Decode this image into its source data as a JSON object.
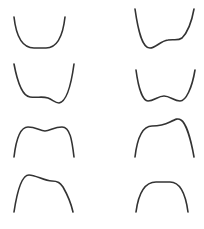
{
  "figure": {
    "stroke_color": "#333333",
    "background": "#ffffff",
    "curves": [
      {
        "id": "u-flat-bottom",
        "shape": "U-shaped well with flat bottom",
        "row": 1,
        "col": 1
      },
      {
        "id": "double-well-left-min",
        "shape": "Asymmetric well, deeper minimum on left with shoulder on right",
        "row": 1,
        "col": 2
      },
      {
        "id": "double-well-right-min",
        "shape": "Asymmetric well, shoulder on left, deeper minimum on right",
        "row": 2,
        "col": 1
      },
      {
        "id": "symmetric-double-well",
        "shape": "Symmetric double well with central bump",
        "row": 2,
        "col": 2
      },
      {
        "id": "symmetric-double-hump",
        "shape": "Inverted symmetric double maximum with central dip",
        "row": 3,
        "col": 1
      },
      {
        "id": "hump-right-max",
        "shape": "Inverted, shoulder on left, higher maximum on right",
        "row": 3,
        "col": 2
      },
      {
        "id": "hump-left-max",
        "shape": "Inverted, higher maximum on left, shoulder on right",
        "row": 4,
        "col": 1
      },
      {
        "id": "n-flat-top",
        "shape": "Inverted U with flat top",
        "row": 4,
        "col": 2
      }
    ]
  }
}
